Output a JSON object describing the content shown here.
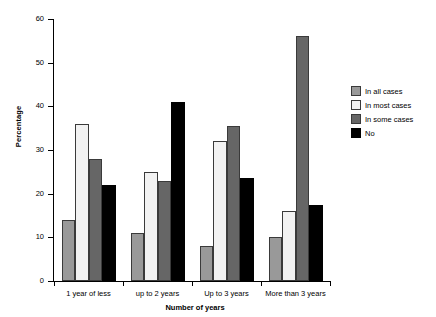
{
  "chart_data": {
    "type": "bar",
    "title": "",
    "xlabel": "Number of years",
    "ylabel": "Percentage",
    "categories": [
      "1 year of less",
      "up to 2 years",
      "Up to 3 years",
      "More than 3 years"
    ],
    "series": [
      {
        "name": "In all cases",
        "color": "#999999",
        "values": [
          14,
          11,
          8,
          10
        ]
      },
      {
        "name": "In most cases",
        "color": "#f2f2f2",
        "values": [
          36,
          25,
          32,
          16
        ]
      },
      {
        "name": "In some cases",
        "color": "#666666",
        "values": [
          28,
          23,
          35.5,
          56
        ]
      },
      {
        "name": "No",
        "color": "#000000",
        "values": [
          22,
          41,
          23.5,
          17.5
        ]
      }
    ],
    "ylim": [
      0,
      60
    ],
    "yticks": [
      0,
      10,
      20,
      30,
      40,
      50,
      60
    ],
    "ytick_labels": [
      "0",
      "10",
      "20",
      "30",
      "40",
      "50",
      "60"
    ],
    "grid": false,
    "legend_position": "right"
  }
}
